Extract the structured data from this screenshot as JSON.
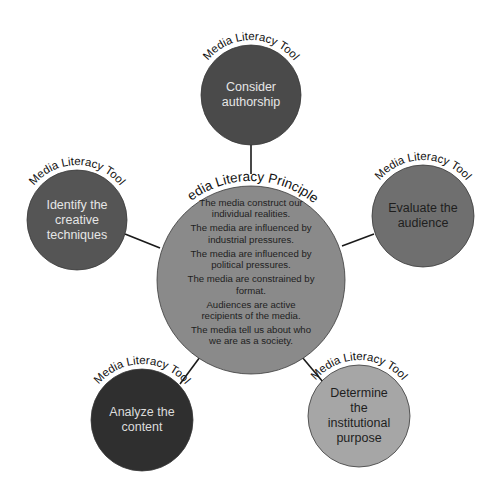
{
  "diagram": {
    "type": "hub-and-spoke",
    "center": {
      "heading": "Media Literacy Principles",
      "fill": "#8a8a8a",
      "text_color": "#1e1e1e",
      "cx": 251,
      "cy": 280,
      "r": 94,
      "principles": [
        {
          "line1": "The media construct our",
          "line2": "individual realities."
        },
        {
          "line1": "The media are influenced by",
          "line2": "industrial pressures."
        },
        {
          "line1": "The media are influenced by",
          "line2": "political pressures."
        },
        {
          "line1": "The media are constrained by",
          "line2": "format."
        },
        {
          "line1": "Audiences are active",
          "line2": "recipients of the media."
        },
        {
          "line1": "The media tell us about who",
          "line2": "we are as a society."
        }
      ]
    },
    "tools": [
      {
        "heading": "Media Literacy Tool",
        "lines": [
          "Consider",
          "authorship"
        ],
        "fill": "#4a4a4a",
        "text_color": "#e6e6e6",
        "cx": 251,
        "cy": 95,
        "r": 50,
        "connector": {
          "x1": 251,
          "y1": 145,
          "x2": 251,
          "y2": 174
        }
      },
      {
        "heading": "Media Literacy Tool",
        "lines": [
          "Identify the",
          "creative",
          "techniques"
        ],
        "fill": "#555555",
        "text_color": "#e6e6e6",
        "cx": 77,
        "cy": 220,
        "r": 50,
        "connector": {
          "x1": 125,
          "y1": 234,
          "x2": 160,
          "y2": 248
        }
      },
      {
        "heading": "Media Literacy Tool",
        "lines": [
          "Evaluate the",
          "audience"
        ],
        "fill": "#6f6f6f",
        "text_color": "#1e1e1e",
        "cx": 423,
        "cy": 216,
        "r": 51,
        "connector": {
          "x1": 342,
          "y1": 246,
          "x2": 374,
          "y2": 234
        }
      },
      {
        "heading": "Media Literacy Tool",
        "lines": [
          "Analyze the",
          "content"
        ],
        "fill": "#2f2f2f",
        "text_color": "#dcdcdc",
        "cx": 142,
        "cy": 420,
        "r": 51,
        "connector": {
          "x1": 180,
          "y1": 384,
          "x2": 200,
          "y2": 357
        }
      },
      {
        "heading": "Media Literacy Tool",
        "lines": [
          "Determine",
          "the",
          "institutional",
          "purpose"
        ],
        "fill": "#a6a6a6",
        "text_color": "#1e1e1e",
        "cx": 359,
        "cy": 416,
        "r": 51,
        "connector": {
          "x1": 302,
          "y1": 357,
          "x2": 323,
          "y2": 382
        }
      }
    ],
    "colors": {
      "background": "#ffffff",
      "connector": "#1a1a1a",
      "outline": "#3a3a3a",
      "arc_text": "#111111"
    }
  }
}
